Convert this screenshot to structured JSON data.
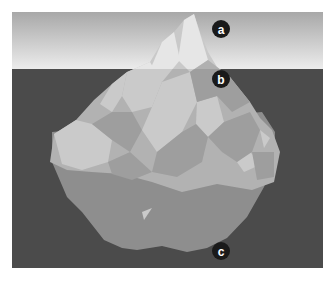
{
  "labels": [
    {
      "id": "a",
      "text": "a",
      "region": "peak above water"
    },
    {
      "id": "b",
      "text": "b",
      "region": "waterline"
    },
    {
      "id": "c",
      "text": "c",
      "region": "base below water"
    }
  ],
  "colors": {
    "sky_top": "#a8a8a8",
    "sky_bottom": "#ececec",
    "water": "#4b4b4b",
    "ice_light": "#e6e6e6",
    "ice_mid": "#c9c9c9",
    "ice_dark": "#b0b0b0",
    "underwater_ice": "#9d9d9d",
    "marker": "#1a1a1a",
    "marker_text": "#ffffff"
  }
}
